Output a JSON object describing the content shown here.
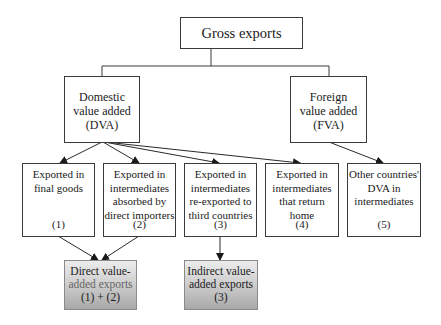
{
  "diagram": {
    "root": {
      "label": "Gross exports"
    },
    "level2": [
      {
        "id": "dva",
        "lines": [
          "Domestic",
          "value added",
          "(DVA)"
        ]
      },
      {
        "id": "fva",
        "lines": [
          "Foreign",
          "value added",
          "(FVA)"
        ]
      }
    ],
    "level3": [
      {
        "id": "c1",
        "lines": [
          "Exported in",
          "final goods"
        ],
        "num": "(1)"
      },
      {
        "id": "c2",
        "lines": [
          "Exported in",
          "intermediates",
          "absorbed by",
          "direct importers"
        ],
        "num": "(2)"
      },
      {
        "id": "c3",
        "lines": [
          "Exported in",
          "intermediates",
          "re-exported to",
          "third countries"
        ],
        "num": "(3)"
      },
      {
        "id": "c4",
        "lines": [
          "Exported in",
          "intermediates",
          "that return",
          "home"
        ],
        "num": "(4)"
      },
      {
        "id": "c5",
        "lines": [
          "Other countries'",
          "DVA in",
          "intermediates"
        ],
        "num": "(5)"
      }
    ],
    "results": [
      {
        "id": "direct",
        "lines": [
          "Direct value-",
          "added exports",
          "(1) + (2)"
        ]
      },
      {
        "id": "indirect",
        "lines": [
          "Indirect value-",
          "added exports",
          "(3)"
        ]
      }
    ],
    "edges": [
      {
        "from": "root",
        "to": "dva",
        "type": "tree-connector"
      },
      {
        "from": "root",
        "to": "fva",
        "type": "tree-connector"
      },
      {
        "from": "dva",
        "to": "c1",
        "type": "arrow"
      },
      {
        "from": "dva",
        "to": "c2",
        "type": "arrow"
      },
      {
        "from": "dva",
        "to": "c3",
        "type": "arrow"
      },
      {
        "from": "dva",
        "to": "c4",
        "type": "arrow"
      },
      {
        "from": "fva",
        "to": "c5",
        "type": "arrow"
      },
      {
        "from": "c1",
        "to": "direct",
        "type": "arrow"
      },
      {
        "from": "c2",
        "to": "direct",
        "type": "arrow"
      },
      {
        "from": "c3",
        "to": "indirect",
        "type": "arrow"
      }
    ],
    "colors": {
      "border": "#3a3a3a",
      "result_fill_top": "#ececec",
      "result_fill_bottom": "#a9a9a9"
    }
  }
}
